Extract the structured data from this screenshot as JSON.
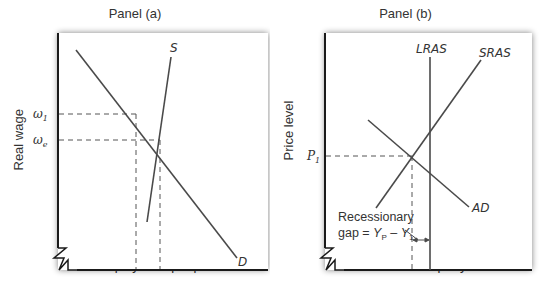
{
  "panel_a": {
    "title": "Panel (a)",
    "xlabel": "Employment per period",
    "ylabel": "Real wage",
    "curves": [
      {
        "name": "S",
        "label": "S",
        "from": [
          170,
          57
        ],
        "to": [
          147,
          222
        ]
      },
      {
        "name": "D",
        "label": "D",
        "from": [
          76,
          50
        ],
        "to": [
          237,
          258
        ]
      }
    ],
    "wage_levels": [
      {
        "symbol": "ω",
        "subscript": "1",
        "y": 114,
        "x_drop": 136
      },
      {
        "symbol": "ω",
        "subscript": "e",
        "y": 140,
        "x_drop": 160
      }
    ]
  },
  "panel_b": {
    "title": "Panel (b)",
    "xlabel": "Real GDP per year",
    "ylabel": "Price level",
    "curves": [
      {
        "name": "LRAS",
        "label": "LRAS"
      },
      {
        "name": "SRAS",
        "label": "SRAS"
      },
      {
        "name": "AD",
        "label": "AD"
      }
    ],
    "price_level": {
      "symbol": "P",
      "subscript": "1"
    },
    "gap_annotation": {
      "line1": "Recessionary",
      "line2_prefix": "gap = ",
      "yp": "Y",
      "yp_sub": "P",
      "minus": " – ",
      "y1": "Y",
      "y1_sub": "1"
    }
  },
  "colors": {
    "axis": "#1a1a1a",
    "curve": "#4a4a4a",
    "dashed": "#555555",
    "shadow": "#9a9a9a",
    "background": "#ffffff"
  }
}
